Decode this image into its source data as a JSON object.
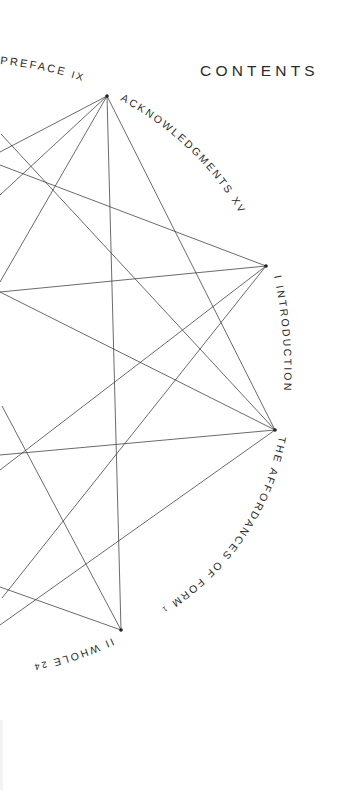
{
  "page": {
    "title": "CONTENTS",
    "background": "#ffffff",
    "ink_color": "#2b2b2b"
  },
  "toc_entries": [
    {
      "label": "PREFACE",
      "page": "IX"
    },
    {
      "label": "ACKNOWLEDGMENTS",
      "page": "XV"
    },
    {
      "label": "I INTRODUCTION",
      "page": ""
    },
    {
      "label": "THE AFFORDANCES OF FORM",
      "page": "1"
    },
    {
      "label": "II WHOLE",
      "page": "24"
    }
  ],
  "diagram": {
    "nodes": [
      {
        "id": "A",
        "x": 107,
        "y": 96
      },
      {
        "id": "B",
        "x": 266,
        "y": 266
      },
      {
        "id": "C",
        "x": 275,
        "y": 430
      },
      {
        "id": "D",
        "x": 121,
        "y": 630
      }
    ]
  }
}
